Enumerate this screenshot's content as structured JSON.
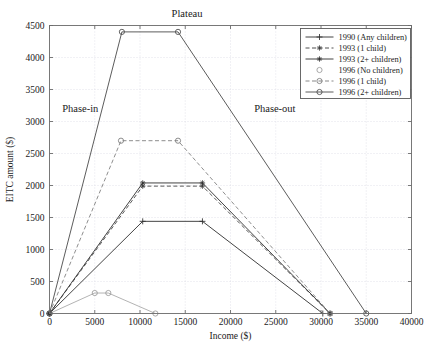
{
  "chart_data": {
    "type": "line",
    "title": "",
    "xlabel": "Income ($)",
    "ylabel": "EITC amount ($)",
    "xlim": [
      0,
      40000
    ],
    "ylim": [
      0,
      4500
    ],
    "xticks": [
      0,
      5000,
      10000,
      15000,
      20000,
      25000,
      30000,
      35000,
      40000
    ],
    "xtick_labels": [
      "0",
      "5000",
      "10000",
      "15000",
      "20000",
      "25000",
      "30000",
      "35000",
      "40000"
    ],
    "yticks": [
      0,
      500,
      1000,
      1500,
      2000,
      2500,
      3000,
      3500,
      4000,
      4500
    ],
    "ytick_labels": [
      "0",
      "500",
      "1000",
      "1500",
      "2000",
      "2500",
      "3000",
      "3500",
      "4000",
      "4500"
    ],
    "grid": true,
    "legend_position": "upper right",
    "annotations": [
      {
        "text": "Plateau",
        "x": 15200,
        "y": 4500
      },
      {
        "text": "Phase-in",
        "x": 3400,
        "y": 3200
      },
      {
        "text": "Phase-out",
        "x": 24900,
        "y": 3200
      }
    ],
    "series": [
      {
        "name": "1990 (Any children)",
        "color": "#2e2e2e",
        "dash": "none",
        "marker": "plus",
        "x": [
          0,
          10300,
          16900,
          30200
        ],
        "y": [
          0,
          1440,
          1440,
          0
        ]
      },
      {
        "name": "1993 (1 child)",
        "color": "#3a3a3a",
        "dash": "dashed",
        "marker": "asterisk",
        "x": [
          0,
          10300,
          16900,
          31000
        ],
        "y": [
          0,
          1990,
          1990,
          0
        ]
      },
      {
        "name": "1993 (2+ children)",
        "color": "#2e2e2e",
        "dash": "none",
        "marker": "asterisk",
        "x": [
          0,
          10300,
          16900,
          31000
        ],
        "y": [
          0,
          2040,
          2040,
          0
        ]
      },
      {
        "name": "1996 (No children)",
        "color": "#9a9a9a",
        "dash": "none",
        "marker": "circle",
        "x": [
          0,
          5000,
          6500,
          11700
        ],
        "y": [
          0,
          320,
          320,
          0
        ]
      },
      {
        "name": "1996 (1 child)",
        "color": "#7a7a7a",
        "dash": "dashed",
        "marker": "circle",
        "x": [
          0,
          7900,
          14200,
          31000
        ],
        "y": [
          0,
          2700,
          2700,
          0
        ]
      },
      {
        "name": "1996 (2+ children)",
        "color": "#4a4a4a",
        "dash": "none",
        "marker": "circle",
        "x": [
          0,
          8000,
          14200,
          35000
        ],
        "y": [
          0,
          4400,
          4400,
          0
        ]
      }
    ]
  }
}
